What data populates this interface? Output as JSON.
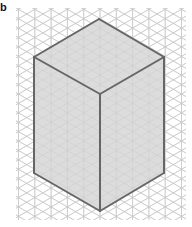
{
  "figure": {
    "label": "b",
    "colors": {
      "background": "#ffffff",
      "grid_line": "#c8c8c8",
      "face_fill": "#dcdcdc",
      "edge": "#666666"
    },
    "grid": {
      "type": "isometric-triangular",
      "spacing_px": 16.3
    },
    "prism": {
      "top_face": [
        [
          99,
          19
        ],
        [
          164,
          57
        ],
        [
          100,
          94
        ],
        [
          34,
          57
        ]
      ],
      "left_face": [
        [
          34,
          57
        ],
        [
          100,
          94
        ],
        [
          100,
          211
        ],
        [
          34,
          173
        ]
      ],
      "right_face": [
        [
          100,
          94
        ],
        [
          164,
          57
        ],
        [
          164,
          173
        ],
        [
          100,
          211
        ]
      ],
      "dimensions_units": {
        "width": 4,
        "depth": 4,
        "height": 7
      }
    }
  }
}
